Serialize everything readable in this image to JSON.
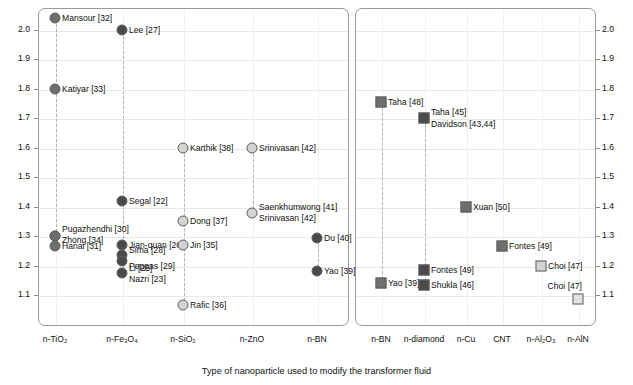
{
  "chart_data": {
    "type": "scatter",
    "title": "",
    "xlabel": "Type of nanoparticle used to modify the transformer fluid",
    "panels": [
      {
        "id": "panel-ac-breakdown",
        "ylabel": "AC breakdown voltage enhancement ratio vs pure dielectric fluid",
        "ylim": [
          1.05,
          2.07
        ],
        "yticks": [
          "1.1",
          "1.2",
          "1.3",
          "1.4",
          "1.5",
          "1.6",
          "1.7",
          "1.8",
          "1.9",
          "2.0"
        ],
        "ytick_values": [
          1.1,
          1.2,
          1.3,
          1.4,
          1.5,
          1.6,
          1.7,
          1.8,
          1.9,
          2.0
        ],
        "categories": [
          "n-TiO2",
          "n-Fe3O4",
          "n-SiO2",
          "n-ZnO",
          "n-BN"
        ],
        "category_labels": [
          "n-TiO₂",
          "n-Fe₃O₄",
          "n-SiO₂",
          "n-ZnO",
          "n-BN"
        ],
        "points": [
          {
            "label": "Mansour [32]",
            "category": "n-TiO2",
            "value": 2.04,
            "marker": "circle",
            "shade": "mid",
            "label_side": "right"
          },
          {
            "label": "Katiyar [33]",
            "category": "n-TiO2",
            "value": 1.8,
            "marker": "circle",
            "shade": "mid",
            "label_side": "right"
          },
          {
            "label": "Pugazhendhi [30]",
            "category": "n-TiO2",
            "value": 1.3,
            "marker": "circle",
            "shade": "mid",
            "label_side": "right",
            "label_offset": -7
          },
          {
            "label": "Zhong [34]",
            "category": "n-TiO2",
            "value": 1.3,
            "marker": "circle",
            "shade": "mid",
            "label_side": "right",
            "label_offset": 4
          },
          {
            "label": "Hanai [31]",
            "category": "n-TiO2",
            "value": 1.265,
            "marker": "circle",
            "shade": "mid",
            "label_side": "right"
          },
          {
            "label": "Lee [27]",
            "category": "n-Fe3O4",
            "value": 2.0,
            "marker": "circle",
            "shade": "dark",
            "label_side": "right"
          },
          {
            "label": "Segal [22]",
            "category": "n-Fe3O4",
            "value": 1.42,
            "marker": "circle",
            "shade": "dark",
            "label_side": "right"
          },
          {
            "label": "Jian-quan [26]",
            "category": "n-Fe3O4",
            "value": 1.27,
            "marker": "circle",
            "shade": "dark",
            "label_side": "right"
          },
          {
            "label": "Sima [28]",
            "category": "n-Fe3O4",
            "value": 1.235,
            "marker": "circle",
            "shade": "dark",
            "label_side": "right",
            "label_offset": -5
          },
          {
            "label": "Peppas [29]",
            "category": "n-Fe3O4",
            "value": 1.215,
            "marker": "circle",
            "shade": "dark",
            "label_side": "right",
            "label_offset": 5
          },
          {
            "label": "Li [25]",
            "category": "n-Fe3O4",
            "value": 1.175,
            "marker": "circle",
            "shade": "dark",
            "label_side": "right",
            "label_offset": -5
          },
          {
            "label": "Nazri [23]",
            "category": "n-Fe3O4",
            "value": 1.175,
            "marker": "none",
            "shade": "dark",
            "label_side": "right",
            "label_offset": 6
          },
          {
            "label": "Dong [37]",
            "category": "n-SiO2",
            "value": 1.35,
            "marker": "circle",
            "shade": "light",
            "label_side": "right"
          },
          {
            "label": "Jin [35]",
            "category": "n-SiO2",
            "value": 1.27,
            "marker": "circle",
            "shade": "light",
            "label_side": "right"
          },
          {
            "label": "Rafic [36]",
            "category": "n-SiO2",
            "value": 1.065,
            "marker": "circle",
            "shade": "light",
            "label_side": "right"
          },
          {
            "label": "Karthik [38]",
            "category": "n-SiO2",
            "value": 1.6,
            "marker": "circle",
            "shade": "light",
            "label_side": "right"
          },
          {
            "label": "Srinivasan [42]",
            "category": "n-ZnO",
            "value": 1.6,
            "marker": "circle",
            "shade": "light",
            "label_side": "right"
          },
          {
            "label": "Saenkhumwong [41]",
            "category": "n-ZnO",
            "value": 1.38,
            "marker": "circle",
            "shade": "light",
            "label_side": "right",
            "label_offset": -6
          },
          {
            "label": "Srinivasan [42]",
            "category": "n-ZnO",
            "value": 1.38,
            "marker": "none",
            "shade": "light",
            "label_side": "right",
            "label_offset": 5
          },
          {
            "label": "Du [40]",
            "category": "n-BN",
            "value": 1.295,
            "marker": "circle",
            "shade": "dark",
            "label_side": "right"
          },
          {
            "label": "Yao [39]",
            "category": "n-BN",
            "value": 1.18,
            "marker": "circle",
            "shade": "dark",
            "label_side": "right"
          }
        ]
      },
      {
        "id": "panel-thermal-conductivity",
        "ylabel": "Thermal conductivity enhancement ratio vs pure dielectric fluid",
        "ylim": [
          1.05,
          2.07
        ],
        "yticks": [
          "1.1",
          "1.2",
          "1.3",
          "1.4",
          "1.5",
          "1.6",
          "1.7",
          "1.8",
          "1.9",
          "2.0"
        ],
        "ytick_values": [
          1.1,
          1.2,
          1.3,
          1.4,
          1.5,
          1.6,
          1.7,
          1.8,
          1.9,
          2.0
        ],
        "categories": [
          "n-BN",
          "n-diamond",
          "n-Cu",
          "CNT",
          "n-Al2O3",
          "n-AlN"
        ],
        "category_labels": [
          "n-BN",
          "n-diamond",
          "n-Cu",
          "CNT",
          "n-Al₂O₃",
          "n-AlN"
        ],
        "points": [
          {
            "label": "Taha [48]",
            "category": "n-BN",
            "value": 1.755,
            "marker": "square",
            "shade": "mid",
            "label_side": "right"
          },
          {
            "label": "Yao [39]",
            "category": "n-BN",
            "value": 1.14,
            "marker": "square",
            "shade": "mid",
            "label_side": "right"
          },
          {
            "label": "Taha [45]",
            "category": "n-diamond",
            "value": 1.7,
            "marker": "square",
            "shade": "dark",
            "label_side": "right",
            "label_offset": -6
          },
          {
            "label": "Davidson [43,44]",
            "category": "n-diamond",
            "value": 1.7,
            "marker": "none",
            "shade": "dark",
            "label_side": "right",
            "label_offset": 6
          },
          {
            "label": "Fontes [49]",
            "category": "n-diamond",
            "value": 1.185,
            "marker": "square",
            "shade": "dark",
            "label_side": "right"
          },
          {
            "label": "Shukla [46]",
            "category": "n-diamond",
            "value": 1.135,
            "marker": "square",
            "shade": "dark",
            "label_side": "right"
          },
          {
            "label": "Xuan [50]",
            "category": "n-Cu",
            "value": 1.4,
            "marker": "square",
            "shade": "mid",
            "label_side": "right"
          },
          {
            "label": "Fontes [49]",
            "category": "CNT",
            "value": 1.265,
            "marker": "square",
            "shade": "mid",
            "label_side": "right"
          },
          {
            "label": "Choi [47]",
            "category": "n-Al2O3",
            "value": 1.2,
            "marker": "square",
            "shade": "light",
            "label_side": "right"
          },
          {
            "label": "Choi [47]",
            "category": "n-AlN",
            "value": 1.085,
            "marker": "square",
            "shade": "vlight",
            "label_side": "above"
          }
        ]
      }
    ]
  }
}
